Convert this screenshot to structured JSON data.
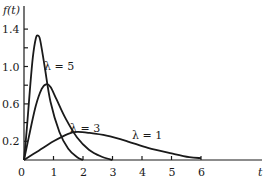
{
  "chart_data": {
    "type": "line",
    "title": "",
    "xlabel": "t",
    "ylabel": "f(t)",
    "xlim": [
      0,
      6.5
    ],
    "ylim": [
      0,
      1.5
    ],
    "x_ticks": [
      "0",
      "1",
      "2",
      "3",
      "4",
      "5",
      "6"
    ],
    "y_ticks": [
      "0.2",
      "0.6",
      "1.0",
      "1.4"
    ],
    "grid": false,
    "legend": "inline annotations",
    "series": [
      {
        "name": "λ = 5",
        "x": [
          0,
          0.1,
          0.2,
          0.3,
          0.4,
          0.47,
          0.55,
          0.7,
          0.9,
          1.2,
          1.5,
          1.8,
          2.0
        ],
        "y": [
          0,
          0.35,
          0.75,
          1.1,
          1.3,
          1.33,
          1.28,
          1.0,
          0.62,
          0.3,
          0.12,
          0.03,
          0
        ]
      },
      {
        "name": "λ = 3",
        "x": [
          0,
          0.2,
          0.4,
          0.6,
          0.75,
          0.9,
          1.1,
          1.4,
          1.8,
          2.2,
          2.6,
          3.0
        ],
        "y": [
          0,
          0.3,
          0.58,
          0.76,
          0.81,
          0.78,
          0.65,
          0.45,
          0.24,
          0.11,
          0.04,
          0
        ]
      },
      {
        "name": "λ = 1",
        "x": [
          0,
          0.5,
          1.0,
          1.5,
          1.8,
          2.2,
          2.8,
          3.5,
          4.2,
          5.0,
          5.6,
          6.0
        ],
        "y": [
          0,
          0.1,
          0.2,
          0.28,
          0.3,
          0.29,
          0.26,
          0.2,
          0.13,
          0.07,
          0.03,
          0.02
        ]
      }
    ],
    "annotations": [
      {
        "text": "λ = 5",
        "x": 0.6,
        "y": 1.0
      },
      {
        "text": "λ = 3",
        "x": 1.6,
        "y": 0.33
      },
      {
        "text": "λ = 1",
        "x": 3.7,
        "y": 0.27
      }
    ]
  },
  "labels": {
    "ylabel": "f(t)",
    "xlabel": "t",
    "origin": "0",
    "lam5": "λ = 5",
    "lam3": "λ = 3",
    "lam1": "λ = 1"
  }
}
